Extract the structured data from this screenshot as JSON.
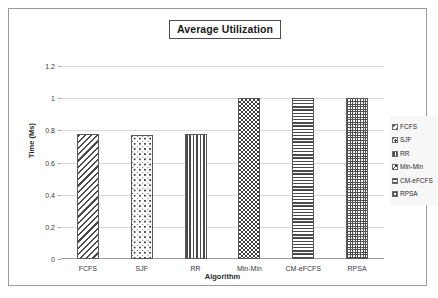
{
  "chart_data": {
    "type": "bar",
    "title": "Average Utilization",
    "xlabel": "Algorithm",
    "ylabel": "Time (Ms)",
    "categories": [
      "FCFS",
      "SJF",
      "RR",
      "Min-Min",
      "CM-eFCFS",
      "RPSA"
    ],
    "values": [
      0.78,
      0.77,
      0.78,
      1.0,
      1.0,
      1.0
    ],
    "ylim": [
      0,
      1.2
    ],
    "yticks": [
      "0",
      "0.2",
      "0.4",
      "0.6",
      "0.8",
      "1",
      "1.2"
    ],
    "ytick_values": [
      0,
      0.2,
      0.4,
      0.6,
      0.8,
      1,
      1.2
    ],
    "grid": true,
    "legend_position": "right",
    "legend": [
      {
        "label": "FCFS",
        "pattern": "diagonal-hatch"
      },
      {
        "label": "SJF",
        "pattern": "dots"
      },
      {
        "label": "RR",
        "pattern": "vertical-stripes"
      },
      {
        "label": "Min-Min",
        "pattern": "checkerboard"
      },
      {
        "label": "CM-eFCFS",
        "pattern": "horizontal-stripes"
      },
      {
        "label": "RPSA",
        "pattern": "fine-grid"
      }
    ],
    "bar_patterns": [
      "diagonal-hatch",
      "dots",
      "vertical-stripes",
      "checkerboard",
      "horizontal-stripes",
      "fine-grid"
    ],
    "colors": {
      "gridline": "#d8d8d8",
      "axis": "#9d9d9d",
      "bar_outline": "#5a5a5a",
      "bar_fill": "#ffffff",
      "text": "#2b2b2b",
      "frame": "#9a9a9a",
      "legend_background": "#f7f7f7"
    }
  }
}
